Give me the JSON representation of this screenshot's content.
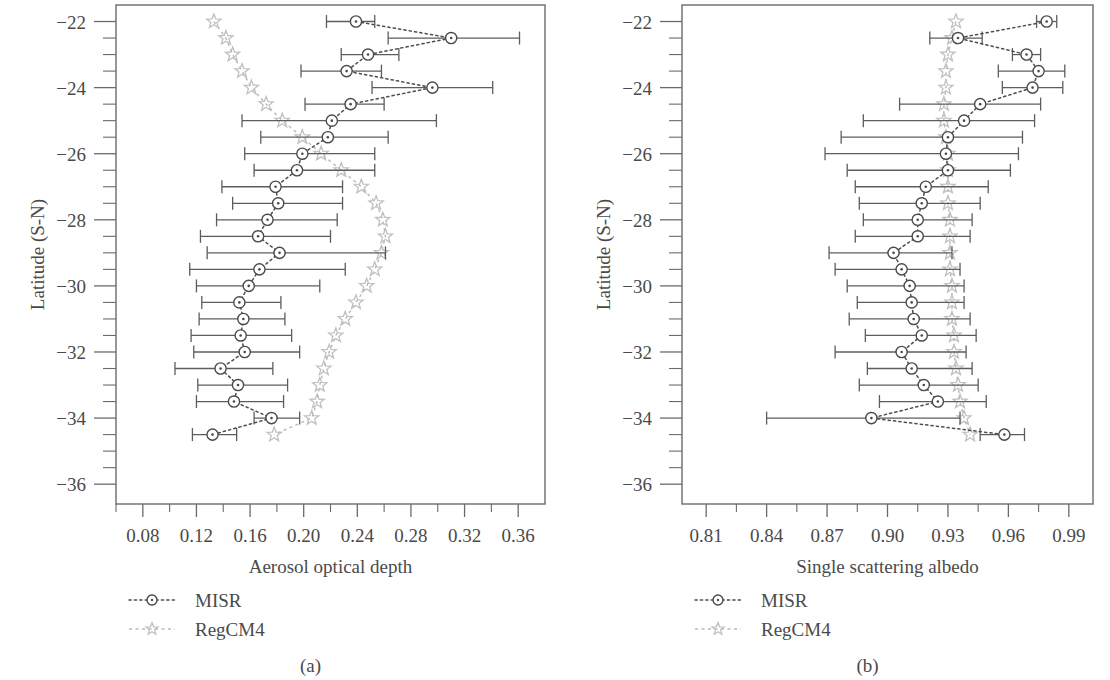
{
  "figure": {
    "panels": [
      {
        "id": "a",
        "caption": "(a)",
        "xlabel": "Aerosol optical depth",
        "ylabel": "Latitude (S-N)"
      },
      {
        "id": "b",
        "caption": "(b)",
        "xlabel": "Single scattering albedo",
        "ylabel": "Latitude (S-N)"
      }
    ],
    "legend": {
      "items": [
        {
          "label": "MISR",
          "style": "dotted-open-circle",
          "color": "#4a4a4a"
        },
        {
          "label": "RegCM4",
          "style": "dashed-open-star",
          "color": "#c0c0c0"
        }
      ]
    }
  },
  "chart_data": [
    {
      "type": "scatter",
      "panel": "a",
      "title": "",
      "xlabel": "Aerosol optical depth",
      "ylabel": "Latitude (S-N)",
      "xlim": [
        0.06,
        0.38
      ],
      "ylim": [
        -36.6,
        -21.5
      ],
      "xticks": [
        0.08,
        0.12,
        0.16,
        0.2,
        0.24,
        0.28,
        0.32,
        0.36
      ],
      "xticklabels": [
        "0.08",
        "0.12",
        "0.16",
        "0.20",
        "0.24",
        "0.28",
        "0.32",
        "0.36"
      ],
      "xminor_step": 0.02,
      "yticks": [
        -22,
        -24,
        -26,
        -28,
        -30,
        -32,
        -34,
        -36
      ],
      "yticklabels": [
        "−22",
        "−24",
        "−26",
        "−28",
        "−30",
        "−32",
        "−34",
        "−36"
      ],
      "yminor_step": 0.5,
      "grid": false,
      "orientation": "horizontal-errorbars",
      "legend_position": "below-left",
      "series": [
        {
          "name": "MISR",
          "marker": "open-circle",
          "line": "dotted",
          "y": [
            -22.0,
            -22.5,
            -23.0,
            -23.5,
            -24.0,
            -24.5,
            -25.0,
            -25.5,
            -26.0,
            -26.5,
            -27.0,
            -27.5,
            -28.0,
            -28.5,
            -29.0,
            -29.5,
            -30.0,
            -30.5,
            -31.0,
            -31.5,
            -32.0,
            -32.5,
            -33.0,
            -33.5,
            -34.0,
            -34.5
          ],
          "values": [
            0.239,
            0.31,
            0.248,
            0.232,
            0.296,
            0.235,
            0.221,
            0.218,
            0.199,
            0.195,
            0.179,
            0.181,
            0.173,
            0.166,
            0.182,
            0.167,
            0.159,
            0.152,
            0.155,
            0.153,
            0.156,
            0.138,
            0.151,
            0.148,
            0.176,
            0.132
          ],
          "err_low": [
            0.217,
            0.263,
            0.228,
            0.198,
            0.251,
            0.201,
            0.154,
            0.168,
            0.156,
            0.163,
            0.139,
            0.147,
            0.135,
            0.123,
            0.128,
            0.115,
            0.12,
            0.124,
            0.122,
            0.116,
            0.118,
            0.104,
            0.121,
            0.12,
            0.163,
            0.117
          ],
          "err_high": [
            0.253,
            0.361,
            0.271,
            0.258,
            0.341,
            0.26,
            0.299,
            0.263,
            0.253,
            0.253,
            0.229,
            0.229,
            0.225,
            0.22,
            0.261,
            0.231,
            0.212,
            0.183,
            0.186,
            0.191,
            0.197,
            0.177,
            0.188,
            0.185,
            0.197,
            0.15
          ]
        },
        {
          "name": "RegCM4",
          "marker": "open-star",
          "line": "dashed",
          "y": [
            -22.0,
            -22.5,
            -23.0,
            -23.5,
            -24.0,
            -24.5,
            -25.0,
            -25.5,
            -26.0,
            -26.5,
            -27.0,
            -27.5,
            -28.0,
            -28.5,
            -29.0,
            -29.5,
            -30.0,
            -30.5,
            -31.0,
            -31.5,
            -32.0,
            -32.5,
            -33.0,
            -33.5,
            -34.0,
            -34.5
          ],
          "values": [
            0.133,
            0.142,
            0.147,
            0.154,
            0.161,
            0.172,
            0.184,
            0.199,
            0.213,
            0.228,
            0.243,
            0.254,
            0.259,
            0.261,
            0.258,
            0.253,
            0.247,
            0.239,
            0.231,
            0.224,
            0.219,
            0.215,
            0.212,
            0.21,
            0.206,
            0.178
          ]
        }
      ]
    },
    {
      "type": "scatter",
      "panel": "b",
      "title": "",
      "xlabel": "Single scattering albedo",
      "ylabel": "Latitude (S-N)",
      "xlim": [
        0.798,
        1.002
      ],
      "ylim": [
        -36.6,
        -21.5
      ],
      "xticks": [
        0.81,
        0.84,
        0.87,
        0.9,
        0.93,
        0.96,
        0.99
      ],
      "xticklabels": [
        "0.81",
        "0.84",
        "0.87",
        "0.90",
        "0.93",
        "0.96",
        "0.99"
      ],
      "xminor_step": 0.015,
      "yticks": [
        -22,
        -24,
        -26,
        -28,
        -30,
        -32,
        -34,
        -36
      ],
      "yticklabels": [
        "−22",
        "−24",
        "−26",
        "−28",
        "−30",
        "−32",
        "−34",
        "−36"
      ],
      "yminor_step": 0.5,
      "grid": false,
      "orientation": "horizontal-errorbars",
      "legend_position": "below-left",
      "series": [
        {
          "name": "MISR",
          "marker": "open-circle",
          "line": "dotted",
          "y": [
            -22.0,
            -22.5,
            -23.0,
            -23.5,
            -24.0,
            -24.5,
            -25.0,
            -25.5,
            -26.0,
            -26.5,
            -27.0,
            -27.5,
            -28.0,
            -28.5,
            -29.0,
            -29.5,
            -30.0,
            -30.5,
            -31.0,
            -31.5,
            -32.0,
            -32.5,
            -33.0,
            -33.5,
            -34.0,
            -34.5
          ],
          "values": [
            0.979,
            0.935,
            0.969,
            0.975,
            0.972,
            0.946,
            0.938,
            0.93,
            0.929,
            0.93,
            0.919,
            0.917,
            0.915,
            0.915,
            0.903,
            0.907,
            0.911,
            0.912,
            0.913,
            0.917,
            0.907,
            0.912,
            0.918,
            0.925,
            0.892,
            0.958
          ],
          "err_low": [
            0.974,
            0.921,
            0.962,
            0.955,
            0.957,
            0.906,
            0.888,
            0.877,
            0.869,
            0.88,
            0.884,
            0.886,
            0.888,
            0.884,
            0.871,
            0.874,
            0.88,
            0.885,
            0.881,
            0.889,
            0.874,
            0.89,
            0.886,
            0.896,
            0.84,
            0.946
          ],
          "err_high": [
            0.984,
            0.947,
            0.976,
            0.988,
            0.987,
            0.976,
            0.973,
            0.967,
            0.965,
            0.961,
            0.95,
            0.946,
            0.942,
            0.941,
            0.932,
            0.936,
            0.938,
            0.938,
            0.941,
            0.944,
            0.939,
            0.942,
            0.945,
            0.949,
            0.936,
            0.968
          ]
        },
        {
          "name": "RegCM4",
          "marker": "open-star",
          "line": "dashed",
          "y": [
            -22.0,
            -22.5,
            -23.0,
            -23.5,
            -24.0,
            -24.5,
            -25.0,
            -25.5,
            -26.0,
            -26.5,
            -27.0,
            -27.5,
            -28.0,
            -28.5,
            -29.0,
            -29.5,
            -30.0,
            -30.5,
            -31.0,
            -31.5,
            -32.0,
            -32.5,
            -33.0,
            -33.5,
            -34.0,
            -34.5
          ],
          "values": [
            0.934,
            0.932,
            0.93,
            0.929,
            0.929,
            0.928,
            0.928,
            0.929,
            0.93,
            0.93,
            0.93,
            0.93,
            0.931,
            0.931,
            0.931,
            0.931,
            0.932,
            0.932,
            0.932,
            0.933,
            0.933,
            0.934,
            0.935,
            0.936,
            0.938,
            0.941
          ]
        }
      ]
    }
  ]
}
